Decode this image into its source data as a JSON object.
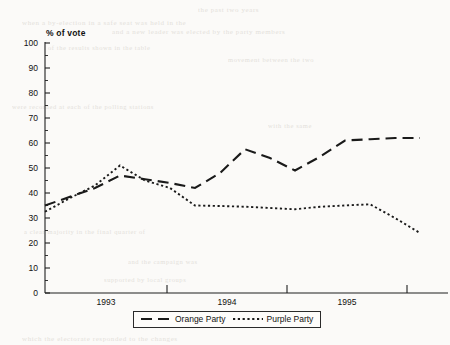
{
  "chart_data": {
    "type": "line",
    "title": "",
    "xlabel": "",
    "ylabel": "% of vote",
    "ylim": [
      0,
      100
    ],
    "yticks": [
      0,
      10,
      20,
      30,
      40,
      50,
      60,
      70,
      80,
      90,
      100
    ],
    "xticks": [
      "1993",
      "1994",
      "1995"
    ],
    "grid": false,
    "legend_position": "bottom",
    "x": [
      0,
      1,
      2,
      3,
      4,
      5,
      6,
      7,
      8,
      9,
      10,
      11,
      12,
      13,
      14,
      15
    ],
    "series": [
      {
        "name": "Orange Party",
        "linestyle": "long-dash",
        "color": "#1a1a1a",
        "values": [
          35,
          38.5,
          42,
          47,
          45.5,
          44,
          42,
          48,
          57.5,
          54,
          49,
          54.5,
          61,
          61.5,
          62,
          62
        ]
      },
      {
        "name": "Purple Party",
        "linestyle": "dotted",
        "color": "#1a1a1a",
        "values": [
          32.5,
          38,
          43,
          51,
          45,
          42,
          35,
          34.8,
          34.5,
          34,
          33.5,
          34.5,
          35,
          35.5,
          30,
          24
        ]
      }
    ]
  },
  "axis": {
    "y_label": "% of vote",
    "y_tick_labels": [
      "100",
      "90",
      "80",
      "70",
      "60",
      "50",
      "40",
      "30",
      "20",
      "10",
      "0"
    ],
    "x_tick_labels": [
      "1993",
      "1994",
      "1995"
    ]
  },
  "legend": {
    "items": [
      {
        "label": "Orange Party",
        "style": "long-dash"
      },
      {
        "label": "Purple Party",
        "style": "dotted"
      }
    ]
  },
  "background_artifacts": [
    {
      "text": "the  past  two  years",
      "x": 198,
      "y": 6,
      "size": 7
    },
    {
      "text": "when a  by-election in  a  safe  seat  was  held  in  the",
      "x": 22,
      "y": 19,
      "size": 7
    },
    {
      "text": "and  a  new  leader  was  elected  by  the  party  members",
      "x": 112,
      "y": 28,
      "size": 7
    },
    {
      "text": "of  the  results  shown  in  the  table",
      "x": 48,
      "y": 44,
      "size": 6.5
    },
    {
      "text": "movement  between  the  two",
      "x": 228,
      "y": 56,
      "size": 6.5
    },
    {
      "text": "were  recorded  at  each  of  the  polling  stations",
      "x": 12,
      "y": 103,
      "size": 6.5
    },
    {
      "text": "with  the  same",
      "x": 268,
      "y": 122,
      "size": 6.5
    },
    {
      "text": "a  clear  majority  in  the  final  quarter  of",
      "x": 24,
      "y": 228,
      "size": 6.5
    },
    {
      "text": "and  the  campaign  was",
      "x": 128,
      "y": 258,
      "size": 6.5
    },
    {
      "text": "supported  by  local  groups",
      "x": 104,
      "y": 276,
      "size": 6.5
    },
    {
      "text": "which  the  electorate  responded  to  the  changes",
      "x": 22,
      "y": 335,
      "size": 7
    }
  ]
}
